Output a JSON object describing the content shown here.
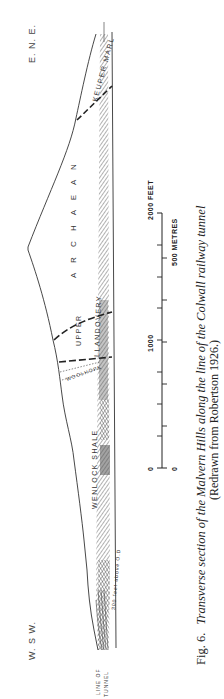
{
  "figure": {
    "directions": {
      "west": "W. S W.",
      "east": "E. N. E."
    },
    "units": {
      "keuper_marl": "KEUPER MARL",
      "archaean": "A R C H A E A N",
      "upper": "UPPER",
      "llandovery": "LLANDOVERY",
      "woolhope": "WOOLHOPE",
      "wenlock_shale": "WENLOCK SHALE"
    },
    "annotations": {
      "datum": "300 feet above O.D",
      "line_of": "LINE OF",
      "tunnel": "TUNNEL"
    },
    "scale_bar": {
      "feet_labels": [
        "0",
        "1000",
        "2000 FEET"
      ],
      "metre_labels": [
        "0",
        "500 METRES"
      ]
    },
    "caption": {
      "fig_number": "Fig. 6.",
      "title": "Transverse section of the Malvern Hills along the line of the Colwall railway tunnel",
      "source": "(Redrawn from Robertson 1926.)"
    }
  }
}
